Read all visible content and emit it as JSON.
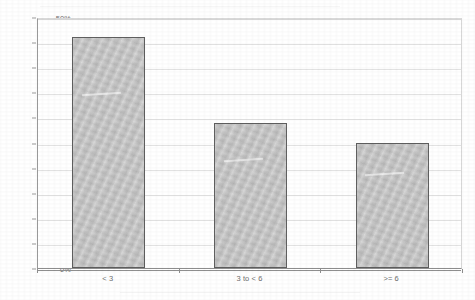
{
  "chart_data": {
    "type": "bar",
    "title": "",
    "subtitle": "",
    "xlabel": "",
    "ylabel": "",
    "categories": [
      "< 3",
      "3 to < 6",
      ">= 6"
    ],
    "values": [
      46,
      28.8,
      25
    ],
    "value_labels": [
      "46%",
      "28.8%",
      "25%"
    ],
    "ylim": [
      0,
      50
    ],
    "ytick_labels": [
      "0%",
      "5%",
      "10%",
      "15%",
      "20%",
      "25%",
      "30%",
      "35%",
      "40%",
      "45%",
      "50%"
    ],
    "ytick_values": [
      0,
      5,
      10,
      15,
      20,
      25,
      30,
      35,
      40,
      45,
      50
    ],
    "grid": true,
    "legend": false,
    "legend_position": "none",
    "series": [
      {
        "name": "",
        "values": [
          46,
          28.8,
          25
        ]
      }
    ],
    "colors": {
      "bar_fill": "#c4c4c4",
      "bar_border": "#5f5f5f",
      "gridline": "#e2e2e2",
      "axis": "#8f8f8f",
      "tick_text": "#6e6e6e",
      "background": "#ffffff"
    }
  }
}
